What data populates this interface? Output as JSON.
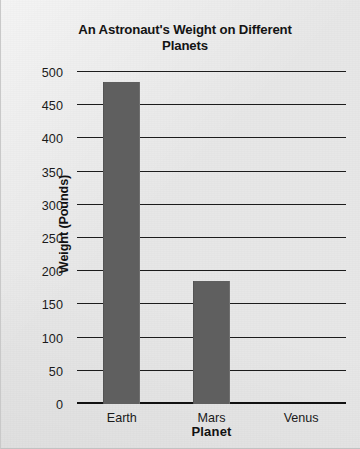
{
  "chart_data": {
    "type": "bar",
    "title": "An Astronaut's Weight on Different Planets",
    "title_line1": "An Astronaut's Weight on Different",
    "title_line2": "Planets",
    "xlabel": "Planet",
    "ylabel": "Weight (Pounds)",
    "categories": [
      "Earth",
      "Mars",
      "Venus"
    ],
    "values": [
      485,
      185,
      0
    ],
    "ylim": [
      0,
      500
    ],
    "ytick_step": 50,
    "yticks": [
      500,
      450,
      400,
      350,
      300,
      250,
      200,
      150,
      100,
      50,
      0
    ],
    "grid": true,
    "legend": null,
    "bar_color": "#5f5f5f",
    "axis_color": "#1c1c1c",
    "background_color": "#e7e7e7"
  }
}
